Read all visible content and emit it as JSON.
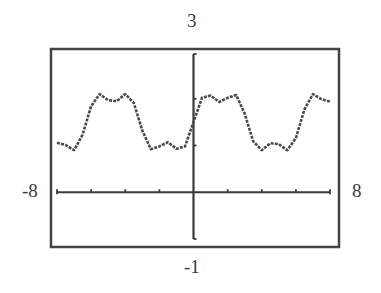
{
  "window": {
    "xmin_label": "-8",
    "xmax_label": "8",
    "ymax_label": "3",
    "ymin_label": "-1"
  },
  "colors": {
    "frame": "#444444",
    "axis": "#3a3a3a",
    "curve": "#4a4a4a",
    "background": "#ffffff"
  },
  "chart_data": {
    "type": "line",
    "title": "",
    "xlabel": "",
    "ylabel": "",
    "xlim": [
      -8,
      8
    ],
    "ylim": [
      -1,
      3
    ],
    "x_tick_step": 2,
    "y_tick_step": 1,
    "grid": false,
    "legend": null,
    "annotations": [
      "-8",
      "8",
      "3",
      "-1"
    ],
    "series": [
      {
        "name": "y = 1.5 + (2/π)(sin x + sin 3x / 3)",
        "x": [
          -8,
          -7.5,
          -7,
          -6.5,
          -6,
          -5.5,
          -5,
          -4.5,
          -4,
          -3.5,
          -3,
          -2.5,
          -2,
          -1.5,
          -1,
          -0.5,
          0,
          0.5,
          1,
          1.5,
          2,
          2.5,
          3,
          3.5,
          4,
          4.5,
          5,
          5.5,
          6,
          6.5,
          7,
          7.5,
          8
        ],
        "values": [
          1.06,
          1.01,
          0.9,
          1.23,
          1.84,
          2.1,
          1.97,
          1.95,
          2.1,
          1.91,
          1.32,
          0.92,
          0.98,
          1.07,
          0.93,
          0.98,
          1.5,
          2.02,
          2.07,
          1.93,
          2.02,
          2.08,
          1.68,
          1.09,
          0.9,
          1.05,
          1.03,
          0.9,
          1.16,
          1.77,
          2.1,
          1.99,
          1.94
        ]
      }
    ]
  }
}
